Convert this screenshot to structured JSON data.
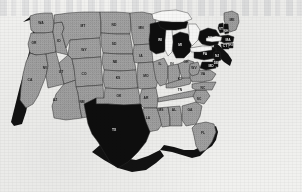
{
  "figure": {
    "name": "united-states-choropleth-map",
    "medium": "scanned-halftone-print",
    "projection": "albers-usa"
  },
  "colors": {
    "paper": "#f1f1ef",
    "state_light": "#a8a8a8",
    "state_dark": "#0d0d0d",
    "border": "#2b2b2b",
    "lake": "#fbfbfa",
    "label_on_light": "#1d1d1d",
    "label_on_dark": "#e8e8e8",
    "coast_shadow": "#121212"
  },
  "legend_categories": [
    {
      "key": "light",
      "swatch": "#a8a8a8",
      "label": ""
    },
    {
      "key": "dark",
      "swatch": "#0d0d0d",
      "label": ""
    }
  ],
  "chart_data": {
    "type": "map",
    "title": "",
    "subtitle": "",
    "region": "contiguous-united-states",
    "value_encoding": "two-category fill: light gray vs solid black",
    "categories": [
      "light",
      "dark"
    ],
    "dark_states": [
      "TX",
      "WI",
      "MI",
      "NY",
      "PA",
      "VT",
      "NH",
      "MA",
      "CT",
      "RI",
      "NJ",
      "DE",
      "MD"
    ],
    "light_states": [
      "WA",
      "OR",
      "CA",
      "NV",
      "ID",
      "MT",
      "WY",
      "UT",
      "AZ",
      "CO",
      "NM",
      "ND",
      "SD",
      "NE",
      "KS",
      "OK",
      "MN",
      "IA",
      "MO",
      "AR",
      "LA",
      "IL",
      "IN",
      "OH",
      "KY",
      "TN",
      "MS",
      "AL",
      "GA",
      "FL",
      "SC",
      "NC",
      "VA",
      "WV",
      "ME"
    ],
    "states": [
      {
        "abbr": "WA",
        "fill": "light",
        "cx": 41,
        "cy": 23
      },
      {
        "abbr": "OR",
        "fill": "light",
        "cx": 34,
        "cy": 43
      },
      {
        "abbr": "CA",
        "fill": "light",
        "cx": 30,
        "cy": 80
      },
      {
        "abbr": "NV",
        "fill": "light",
        "cx": 45,
        "cy": 68
      },
      {
        "abbr": "ID",
        "fill": "light",
        "cx": 59,
        "cy": 41
      },
      {
        "abbr": "MT",
        "fill": "light",
        "cx": 83,
        "cy": 26
      },
      {
        "abbr": "WY",
        "fill": "light",
        "cx": 84,
        "cy": 50
      },
      {
        "abbr": "UT",
        "fill": "light",
        "cx": 61,
        "cy": 72
      },
      {
        "abbr": "AZ",
        "fill": "light",
        "cx": 55,
        "cy": 100
      },
      {
        "abbr": "CO",
        "fill": "light",
        "cx": 84,
        "cy": 74
      },
      {
        "abbr": "NM",
        "fill": "light",
        "cx": 82,
        "cy": 102
      },
      {
        "abbr": "ND",
        "fill": "light",
        "cx": 114,
        "cy": 25
      },
      {
        "abbr": "SD",
        "fill": "light",
        "cx": 114,
        "cy": 44
      },
      {
        "abbr": "NE",
        "fill": "light",
        "cx": 115,
        "cy": 62
      },
      {
        "abbr": "KS",
        "fill": "light",
        "cx": 118,
        "cy": 78
      },
      {
        "abbr": "OK",
        "fill": "light",
        "cx": 119,
        "cy": 96
      },
      {
        "abbr": "TX",
        "fill": "dark",
        "cx": 114,
        "cy": 130
      },
      {
        "abbr": "MN",
        "fill": "light",
        "cx": 141,
        "cy": 28
      },
      {
        "abbr": "IA",
        "fill": "light",
        "cx": 141,
        "cy": 56
      },
      {
        "abbr": "MO",
        "fill": "light",
        "cx": 146,
        "cy": 76
      },
      {
        "abbr": "AR",
        "fill": "light",
        "cx": 146,
        "cy": 98
      },
      {
        "abbr": "LA",
        "fill": "light",
        "cx": 148,
        "cy": 118
      },
      {
        "abbr": "WI",
        "fill": "dark",
        "cx": 160,
        "cy": 40
      },
      {
        "abbr": "IL",
        "fill": "light",
        "cx": 160,
        "cy": 64
      },
      {
        "abbr": "MS",
        "fill": "light",
        "cx": 161,
        "cy": 110
      },
      {
        "abbr": "MI",
        "fill": "dark",
        "cx": 180,
        "cy": 45
      },
      {
        "abbr": "IN",
        "fill": "light",
        "cx": 172,
        "cy": 64
      },
      {
        "abbr": "KY",
        "fill": "light",
        "cx": 180,
        "cy": 79
      },
      {
        "abbr": "TN",
        "fill": "light",
        "cx": 180,
        "cy": 90
      },
      {
        "abbr": "AL",
        "fill": "light",
        "cx": 174,
        "cy": 110
      },
      {
        "abbr": "OH",
        "fill": "light",
        "cx": 186,
        "cy": 62
      },
      {
        "abbr": "GA",
        "fill": "light",
        "cx": 190,
        "cy": 110
      },
      {
        "abbr": "FL",
        "fill": "light",
        "cx": 203,
        "cy": 133
      },
      {
        "abbr": "SC",
        "fill": "light",
        "cx": 199,
        "cy": 99
      },
      {
        "abbr": "NC",
        "fill": "light",
        "cx": 203,
        "cy": 88
      },
      {
        "abbr": "VA",
        "fill": "light",
        "cx": 203,
        "cy": 74
      },
      {
        "abbr": "WV",
        "fill": "light",
        "cx": 194,
        "cy": 68
      },
      {
        "abbr": "PA",
        "fill": "dark",
        "cx": 205,
        "cy": 54
      },
      {
        "abbr": "NY",
        "fill": "dark",
        "cx": 210,
        "cy": 38
      },
      {
        "abbr": "ME",
        "fill": "light",
        "cx": 232,
        "cy": 20
      },
      {
        "abbr": "VT",
        "fill": "dark",
        "cx": 221,
        "cy": 29
      },
      {
        "abbr": "NH",
        "fill": "dark",
        "cx": 226,
        "cy": 31
      },
      {
        "abbr": "MA",
        "fill": "dark",
        "cx": 228,
        "cy": 40
      },
      {
        "abbr": "CT",
        "fill": "dark",
        "cx": 225,
        "cy": 46
      },
      {
        "abbr": "RI",
        "fill": "dark",
        "cx": 231,
        "cy": 45
      },
      {
        "abbr": "NJ",
        "fill": "dark",
        "cx": 217,
        "cy": 56
      },
      {
        "abbr": "DE",
        "fill": "dark",
        "cx": 216,
        "cy": 63
      },
      {
        "abbr": "MD",
        "fill": "dark",
        "cx": 211,
        "cy": 66
      }
    ],
    "lakes": [
      "Lake Superior",
      "Lake Michigan",
      "Lake Huron",
      "Lake Erie",
      "Lake Ontario"
    ],
    "grid": false,
    "legend_position": "none",
    "axis_labels_shown": false
  }
}
